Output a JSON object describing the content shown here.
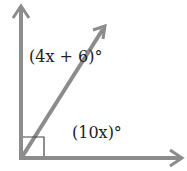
{
  "diagram": {
    "type": "angle-diagram",
    "right_angle_marker": true,
    "colors": {
      "ray": "#8c8c8c",
      "marker": "#444444",
      "text": "#222222"
    },
    "angles": [
      {
        "name": "upper-angle",
        "label": "(4x + 6)°"
      },
      {
        "name": "lower-angle",
        "label": "(10x)°"
      }
    ]
  }
}
